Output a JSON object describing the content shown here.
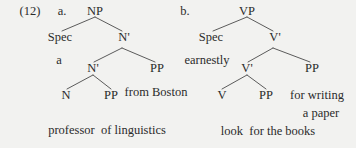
{
  "figure": {
    "example_number": "(12)",
    "style": {
      "background": "#f2f2f0",
      "text_color": "#2b2b2b",
      "line_color": "#4a4a4a"
    }
  },
  "trees": [
    {
      "item_letter": "a.",
      "root": "NP",
      "nodes": {
        "np": "NP",
        "spec": "Spec",
        "n_bar_upper": "N'",
        "spec_terminal": "a",
        "n_bar_lower": "N'",
        "pp_right": "PP",
        "n": "N",
        "pp_inner": "PP"
      },
      "adjunct_text": "from Boston",
      "baseline_text": "professor  of linguistics"
    },
    {
      "item_letter": "b.",
      "root": "VP",
      "nodes": {
        "vp": "VP",
        "spec": "Spec",
        "v_bar_upper": "V'",
        "spec_terminal": "earnestly",
        "v_bar_lower": "V'",
        "pp_right": "PP",
        "v": "V",
        "pp_inner": "PP"
      },
      "adjunct_text_line1": "for writing",
      "adjunct_text_line2": "a paper",
      "baseline_text": "look  for the books"
    }
  ]
}
